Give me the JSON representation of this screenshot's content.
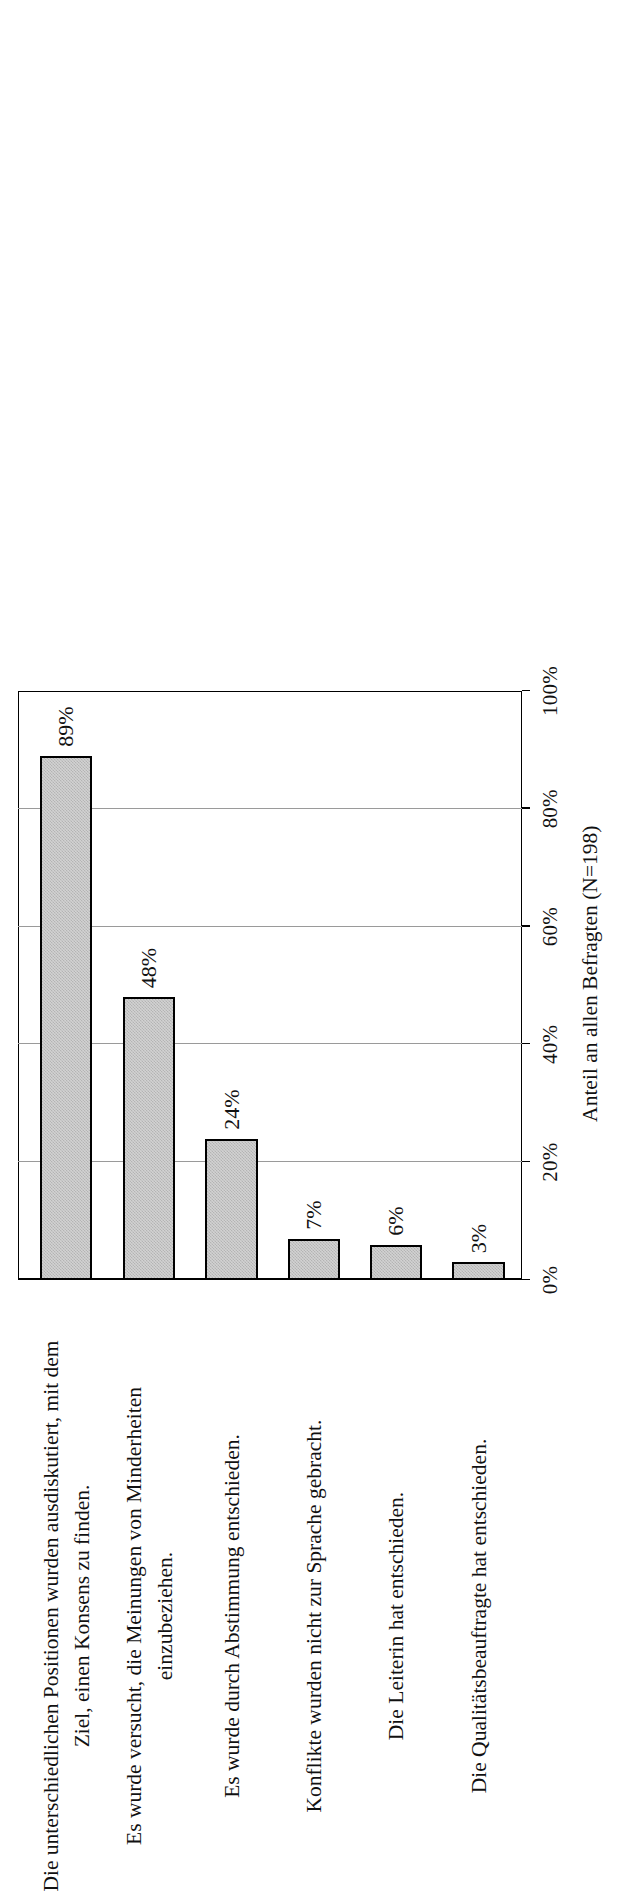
{
  "chart_data": {
    "type": "bar",
    "orientation": "vertical-rotated-90ccw",
    "title": "",
    "subtitle": "",
    "xlabel": "",
    "ylabel": "Anteil an allen Befragten (N=198)",
    "ylim": [
      0,
      100
    ],
    "grid": true,
    "legend": null,
    "value_suffix": "%",
    "categories": [
      "Die unterschiedlichen Positionen wurden ausdiskutiert, mit dem Ziel, einen Konsens zu finden.",
      "Es wurde versucht, die Meinungen von Minderheiten einzubeziehen.",
      "Es wurde durch Abstimmung entschieden.",
      "Konflikte wurden nicht zur Sprache gebracht.",
      "Die Leiterin hat entschieden.",
      "Die Qualitätsbeauftragte hat entschieden."
    ],
    "category_lines": [
      [
        "Die unterschiedlichen Positionen wurden ausdiskutiert, mit dem",
        "Ziel, einen Konsens zu finden."
      ],
      [
        "Es wurde versucht, die Meinungen von Minderheiten",
        "einzubeziehen."
      ],
      [
        "Es wurde durch Abstimmung entschieden."
      ],
      [
        "Konflikte wurden nicht zur Sprache gebracht."
      ],
      [
        "Die Leiterin hat entschieden."
      ],
      [
        "Die Qualitätsbeauftragte hat entschieden."
      ]
    ],
    "values": [
      89,
      48,
      24,
      7,
      6,
      3
    ],
    "data_labels": [
      "89%",
      "48%",
      "24%",
      "7%",
      "6%",
      "3%"
    ],
    "ticks": [
      0,
      20,
      40,
      60,
      80,
      100
    ],
    "tick_labels": [
      "0%",
      "20%",
      "40%",
      "60%",
      "80%",
      "100%"
    ],
    "colors": {
      "bar_fill": "#d2d2d2",
      "bar_pattern": "#b4b4b4",
      "bar_border": "#000000",
      "gridline": "#9a9a9a",
      "axis": "#000000",
      "text": "#111111",
      "background": "#ffffff"
    }
  }
}
